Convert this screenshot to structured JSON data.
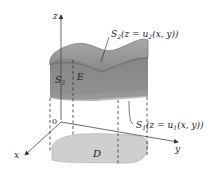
{
  "diagram": {
    "axes": {
      "z_label": "z",
      "x_label": "x",
      "y_label": "y",
      "origin_label": "0"
    },
    "labels": {
      "E": "E",
      "D": "D",
      "S3": "S",
      "S3_sub": "3",
      "S2": "S",
      "S2_sub": "2",
      "S2_eq": "(z = u",
      "S2_eq_sub": "2",
      "S2_eq_tail": "(x, y))",
      "S1": "S",
      "S1_sub": "1",
      "S1_eq": "(z = u",
      "S1_eq_sub": "1",
      "S1_eq_tail": "(x, y))"
    },
    "colors": {
      "top_surface": "#8a8a8a",
      "top_surface_highlight": "#a6a6a6",
      "side_surface": "#7d7d7d",
      "side_lower": "#8f8f8f",
      "region_D": "#cfcfcf",
      "axis": "#444444",
      "dashed": "#333333"
    }
  }
}
